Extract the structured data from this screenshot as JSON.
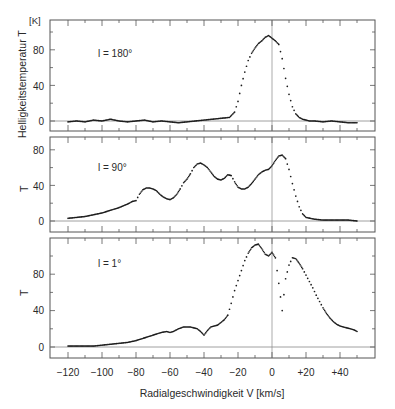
{
  "chart_data": {
    "type": "scatter",
    "title": "",
    "xlabel": "Radialgeschwindigkeit V [km/s]",
    "ylabel": "Helligkeitstemperatur T",
    "yunit": "[K]",
    "xlim": [
      -130,
      60
    ],
    "xticks": [
      -120,
      -100,
      -80,
      -60,
      -40,
      -20,
      0,
      20,
      40
    ],
    "xtick_labels": [
      "−120",
      "−100",
      "−80",
      "−60",
      "−40",
      "−20",
      "0",
      "+20",
      "+40"
    ],
    "grid": false,
    "legend": null,
    "panels": [
      {
        "name": "l = 180°",
        "label": "l = 180°",
        "ylabel": "Helligkeitstemperatur T",
        "yticks": [
          0,
          40,
          80
        ],
        "ylim": [
          -12,
          112
        ],
        "x": [
          -120,
          -115,
          -110,
          -105,
          -100,
          -95,
          -90,
          -85,
          -80,
          -75,
          -70,
          -65,
          -60,
          -55,
          -50,
          -45,
          -40,
          -35,
          -30,
          -25,
          -22,
          -20,
          -18,
          -16,
          -14,
          -12,
          -10,
          -8,
          -6,
          -4,
          -2,
          0,
          2,
          4,
          6,
          8,
          10,
          12,
          14,
          16,
          18,
          20,
          22,
          25,
          30,
          35,
          40,
          45,
          50
        ],
        "values": [
          -1,
          0,
          -1,
          1,
          0,
          2,
          0,
          -1,
          0,
          1,
          -1,
          0,
          -1,
          -2,
          -1,
          0,
          1,
          2,
          3,
          4,
          10,
          22,
          40,
          55,
          68,
          76,
          82,
          87,
          90,
          94,
          96,
          93,
          90,
          86,
          70,
          48,
          30,
          16,
          8,
          4,
          2,
          1,
          0,
          0,
          -1,
          0,
          -1,
          -2,
          -2
        ]
      },
      {
        "name": "l = 90°",
        "label": "l = 90°",
        "ylabel": "T",
        "yticks": [
          0,
          40,
          80
        ],
        "ylim": [
          -12,
          95
        ],
        "x": [
          -120,
          -115,
          -110,
          -105,
          -100,
          -95,
          -90,
          -85,
          -82,
          -80,
          -78,
          -76,
          -74,
          -72,
          -70,
          -68,
          -66,
          -64,
          -62,
          -60,
          -58,
          -56,
          -54,
          -52,
          -50,
          -48,
          -46,
          -44,
          -42,
          -40,
          -38,
          -36,
          -34,
          -32,
          -30,
          -28,
          -26,
          -24,
          -22,
          -20,
          -18,
          -16,
          -14,
          -12,
          -10,
          -8,
          -6,
          -4,
          -2,
          0,
          2,
          4,
          6,
          8,
          10,
          12,
          14,
          16,
          18,
          20,
          25,
          30,
          35,
          40,
          45,
          50
        ],
        "values": [
          3,
          4,
          5,
          7,
          9,
          12,
          15,
          19,
          22,
          23,
          30,
          35,
          37,
          37,
          36,
          34,
          30,
          27,
          25,
          24,
          26,
          30,
          36,
          43,
          47,
          53,
          60,
          64,
          65,
          63,
          60,
          55,
          50,
          47,
          46,
          48,
          52,
          51,
          44,
          38,
          36,
          36,
          38,
          42,
          47,
          52,
          55,
          57,
          58,
          62,
          68,
          73,
          74,
          70,
          58,
          42,
          28,
          16,
          8,
          4,
          2,
          1,
          1,
          1,
          1,
          0
        ]
      },
      {
        "name": "l = 1°",
        "label": "l = 1°",
        "ylabel": "T",
        "yticks": [
          0,
          40,
          80
        ],
        "ylim": [
          -12,
          120
        ],
        "x": [
          -120,
          -115,
          -110,
          -105,
          -100,
          -95,
          -90,
          -85,
          -80,
          -75,
          -70,
          -65,
          -62,
          -60,
          -58,
          -55,
          -52,
          -50,
          -48,
          -46,
          -44,
          -42,
          -40,
          -38,
          -36,
          -34,
          -32,
          -30,
          -28,
          -26,
          -24,
          -22,
          -20,
          -18,
          -16,
          -14,
          -12,
          -10,
          -8,
          -6,
          -4,
          -2,
          0,
          2,
          4,
          5,
          6,
          8,
          10,
          12,
          14,
          16,
          18,
          20,
          22,
          24,
          26,
          28,
          30,
          32,
          34,
          36,
          38,
          40,
          42,
          44,
          46,
          48,
          50
        ],
        "values": [
          1,
          1,
          1,
          1,
          2,
          3,
          4,
          5,
          7,
          10,
          13,
          16,
          17,
          16,
          17,
          20,
          22,
          22,
          22,
          21,
          20,
          17,
          13,
          18,
          22,
          23,
          24,
          27,
          30,
          35,
          48,
          62,
          73,
          84,
          95,
          103,
          109,
          112,
          113,
          108,
          102,
          100,
          104,
          98,
          70,
          55,
          40,
          75,
          90,
          98,
          97,
          92,
          86,
          79,
          72,
          65,
          57,
          50,
          43,
          37,
          32,
          28,
          25,
          23,
          22,
          21,
          20,
          19,
          17
        ]
      }
    ]
  },
  "figure": {
    "ylabel_main": "Helligkeitstemperatur T",
    "yunit": "[K]",
    "panel_ylabels": [
      "T",
      "T"
    ],
    "panel_labels": [
      "l = 180°",
      "l = 90°",
      "l = 1°"
    ],
    "ytick_labels": [
      "0",
      "40",
      "80"
    ],
    "xtick_labels": [
      "−120",
      "−100",
      "−80",
      "−60",
      "−40",
      "−20",
      "0",
      "+20",
      "+40"
    ],
    "xlabel": "Radialgeschwindigkeit V [km/s]"
  }
}
